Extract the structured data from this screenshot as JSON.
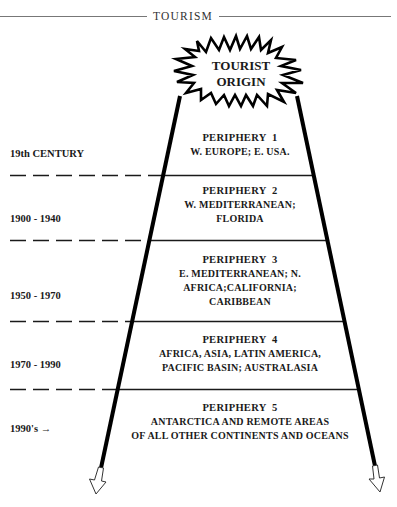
{
  "header": {
    "title": "TOURISM"
  },
  "origin": {
    "line1": "TOURIST",
    "line2": "ORIGIN"
  },
  "peripheries": [
    {
      "title": "PERIPHERY  1",
      "lines": [
        "W. EUROPE; E. USA."
      ],
      "era": "19th CENTURY"
    },
    {
      "title": "PERIPHERY  2",
      "lines": [
        "W. MEDITERRANEAN;",
        "FLORIDA"
      ],
      "era": "1900 - 1940"
    },
    {
      "title": "PERIPHERY  3",
      "lines": [
        "E. MEDITERRANEAN; N.",
        "AFRICA;CALIFORNIA;",
        "CARIBBEAN"
      ],
      "era": "1950 - 1970"
    },
    {
      "title": "PERIPHERY  4",
      "lines": [
        "AFRICA, ASIA, LATIN AMERICA,",
        "PACIFIC BASIN; AUSTRALASIA"
      ],
      "era": "1970 - 1990"
    },
    {
      "title": "PERIPHERY  5",
      "lines": [
        "ANTARCTICA AND REMOTE AREAS",
        "OF ALL OTHER CONTINENTS AND OCEANS"
      ],
      "era": "1990's  →"
    }
  ]
}
